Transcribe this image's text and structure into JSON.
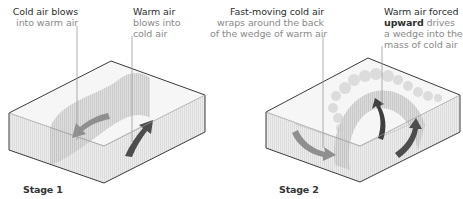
{
  "stages": [
    {
      "title": "Stage 1",
      "labels": [
        {
          "heading": "Cold air blows",
          "body": "into warm air"
        },
        {
          "heading": "Warm air",
          "body_lines": [
            "blows into",
            "cold air"
          ]
        }
      ]
    },
    {
      "title": "Stage 2",
      "labels": [
        {
          "heading": "Fast-moving cold air",
          "body_lines": [
            "wraps around the back",
            "of the wedge of warm air"
          ]
        },
        {
          "heading_lines": [
            "Warm air forced",
            "upward"
          ],
          "body_inline": "drives",
          "body_lines": [
            "a wedge into the",
            "mass of cold air"
          ]
        }
      ]
    }
  ],
  "colors": {
    "box_outline": "#3a3a3a",
    "box_fill": "#f3f3f3",
    "warm_air_wedge": "#cfcfcf",
    "arrow_dark": "#4d4d4d",
    "arrow_light": "#8f8f8f",
    "leader_line": "#9a9a9a",
    "label_heading": "#2e2e2e",
    "label_body": "#8a8a8a"
  }
}
